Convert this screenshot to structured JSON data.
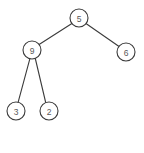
{
  "diagram": {
    "background_color": "#ffffff",
    "stroke_color": "#3b3b3b",
    "label_color": "#5a5a5a",
    "node_radius": 9,
    "nodes": [
      {
        "id": "root",
        "label": "5",
        "x": 79,
        "y": 18,
        "role": "root"
      },
      {
        "id": "left",
        "label": "9",
        "x": 32,
        "y": 50,
        "role": "internal"
      },
      {
        "id": "right",
        "label": "6",
        "x": 126,
        "y": 52,
        "role": "leaf"
      },
      {
        "id": "left-left",
        "label": "3",
        "x": 16,
        "y": 111,
        "role": "leaf"
      },
      {
        "id": "left-right",
        "label": "2",
        "x": 49,
        "y": 111,
        "role": "leaf"
      }
    ],
    "edges": [
      {
        "id": "edge-root-left",
        "from": "root",
        "to": "left",
        "x1": 71.9,
        "y1": 23.5,
        "x2": 39.1,
        "y2": 44.5
      },
      {
        "id": "edge-root-right",
        "from": "root",
        "to": "right",
        "x1": 86.3,
        "y1": 23.7,
        "x2": 118.7,
        "y2": 46.3
      },
      {
        "id": "edge-left-leftleft",
        "from": "left",
        "to": "left-left",
        "x1": 29.9,
        "y1": 58.7,
        "x2": 18.1,
        "y2": 102.3
      },
      {
        "id": "edge-left-leftright",
        "from": "left",
        "to": "left-right",
        "x1": 35.3,
        "y1": 58.5,
        "x2": 45.7,
        "y2": 102.5
      }
    ]
  }
}
